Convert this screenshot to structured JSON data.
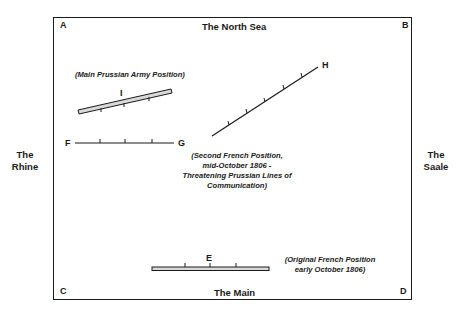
{
  "corners": {
    "a": "A",
    "b": "B",
    "c": "C",
    "d": "D"
  },
  "edges": {
    "north": "The North Sea",
    "south": "The Main",
    "west": [
      "The",
      "Rhine"
    ],
    "east": [
      "The",
      "Saale"
    ]
  },
  "positions": {
    "i": {
      "label": "I",
      "note": "(Main Prussian Army Position)"
    },
    "fg": {
      "start_label": "F",
      "end_label": "G"
    },
    "h": {
      "label": "H",
      "note": [
        "(Second French Position,",
        "mid-October 1806 -",
        "Threatening Prussian Lines of",
        "Communication)"
      ]
    },
    "e": {
      "label": "E",
      "note": [
        "(Original French Position",
        "early October 1806)"
      ]
    }
  },
  "colors": {
    "ink": "#1a1a1a",
    "fill": "#ffffff",
    "position_fill": "#cfcfcf"
  }
}
